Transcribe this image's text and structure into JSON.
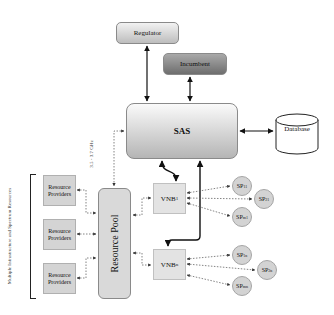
{
  "diagram": {
    "nodes": {
      "regulator": "Regulator",
      "incumbent": "Incumbent",
      "sas": "SAS",
      "database": "Database",
      "resource_pool": "Resource Pool",
      "resource_providers": [
        "Resource Providers",
        "Resource Providers",
        "Resource Providers"
      ],
      "vnb1": {
        "base": "VNB",
        "sub": "1"
      },
      "vnbn": {
        "base": "VNB",
        "sub": "n"
      },
      "sps_group1": [
        {
          "base": "SP",
          "sub": "11"
        },
        {
          "base": "SP",
          "sub": "21"
        },
        {
          "base": "SP",
          "sub": "m1"
        }
      ],
      "sps_group2": [
        {
          "base": "SP",
          "sub": "1n"
        },
        {
          "base": "SP",
          "sub": "2n"
        },
        {
          "base": "SP",
          "sub": "mn"
        }
      ]
    },
    "labels": {
      "frequency": "3.5 - 3.7 GHz",
      "side_label": "Multiple Infrastructure and Spectrum Resources"
    }
  }
}
